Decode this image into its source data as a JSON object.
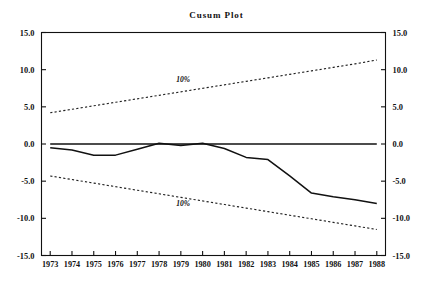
{
  "chart_data": {
    "type": "line",
    "title": "Cusum Plot",
    "xlabel": "",
    "ylabel": "",
    "xlim": [
      1972.6,
      1988.4
    ],
    "ylim": [
      -15.0,
      15.0
    ],
    "grid": false,
    "legend_position": "none",
    "x_tick_labels": [
      "1973",
      "1974",
      "1975",
      "1976",
      "1977",
      "1978",
      "1979",
      "1980",
      "1981",
      "1982",
      "1983",
      "1984",
      "1985",
      "1986",
      "1987",
      "1988"
    ],
    "y_tick_labels_left": [
      "15.0",
      "10.0",
      "5.0",
      "0.0",
      "-5.0",
      "-10.0",
      "-15.0"
    ],
    "y_tick_labels_right": [
      "15.0",
      "10.0",
      "5.0",
      "0.0",
      "-5.0",
      "-10.0",
      "-15.0"
    ],
    "y_tick_values": [
      15.0,
      10.0,
      5.0,
      0.0,
      -5.0,
      -10.0,
      -15.0
    ],
    "x": [
      1973,
      1974,
      1975,
      1976,
      1977,
      1978,
      1979,
      1980,
      1981,
      1982,
      1983,
      1984,
      1985,
      1986,
      1987,
      1988
    ],
    "series": [
      {
        "name": "cusum",
        "style": "solid",
        "color": "#111111",
        "values": [
          -0.5,
          -0.8,
          -1.5,
          -1.5,
          -0.7,
          0.1,
          -0.2,
          0.1,
          -0.6,
          -1.8,
          -2.1,
          -4.3,
          -6.6,
          -7.1,
          -7.5,
          -8.0
        ]
      },
      {
        "name": "upper 10% boundary",
        "style": "dotted",
        "color": "#222222",
        "label": "10%",
        "values": [
          4.2,
          4.67,
          5.14,
          5.61,
          6.08,
          6.55,
          7.02,
          7.49,
          7.96,
          8.43,
          8.9,
          9.37,
          9.84,
          10.31,
          10.78,
          11.3
        ]
      },
      {
        "name": "lower 10% boundary",
        "style": "dotted",
        "color": "#222222",
        "label": "10%",
        "values": [
          -4.3,
          -4.78,
          -5.26,
          -5.74,
          -6.22,
          -6.7,
          -7.18,
          -7.66,
          -8.14,
          -8.62,
          -9.1,
          -9.58,
          -10.06,
          -10.54,
          -11.02,
          -11.5
        ]
      },
      {
        "name": "zero reference",
        "style": "solid",
        "color": "#111111",
        "values": [
          0,
          0,
          0,
          0,
          0,
          0,
          0,
          0,
          0,
          0,
          0,
          0,
          0,
          0,
          0,
          0
        ]
      }
    ],
    "annotations": [
      {
        "text": "10%",
        "x": 1979.1,
        "y": 8.4,
        "name": "upper-band-label"
      },
      {
        "text": "10%",
        "x": 1979.1,
        "y": -8.3,
        "name": "lower-band-label"
      }
    ]
  },
  "figure": {
    "background": "#ffffff",
    "axis_color": "#111111"
  }
}
